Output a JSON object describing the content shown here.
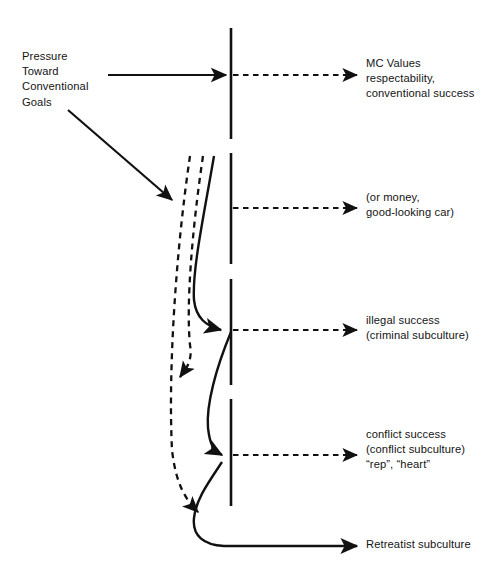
{
  "figure": {
    "type": "flow-diagram",
    "background_color": "#ffffff",
    "line_color": "#111111",
    "width": 492,
    "height": 579
  },
  "labels": {
    "pressure": "Pressure\nToward\nConventional\nGoals",
    "mc_values": "MC Values\nrespectability,\nconventional success",
    "money": "(or money,\ngood-looking car)",
    "illegal": "illegal success\n(criminal subculture)",
    "conflict": "conflict success\n(conflict subculture)\n“rep”, “heart”",
    "retreatist": "Retreatist subculture"
  },
  "structure": {
    "barrier_name": "opportunity-barrier",
    "barrier_style": "vertical dashed line",
    "outcomes": [
      {
        "name": "mc-values",
        "line": "dashed",
        "crosses_barrier": true
      },
      {
        "name": "money",
        "line": "dashed",
        "crosses_barrier": true
      },
      {
        "name": "illegal-success",
        "line": "dashed",
        "crosses_barrier": true
      },
      {
        "name": "conflict-success",
        "line": "dashed",
        "crosses_barrier": true
      },
      {
        "name": "retreatist-subculture",
        "line": "solid",
        "crosses_barrier": true
      }
    ],
    "blocked_paths": [
      {
        "name": "blocked-path-upper",
        "line": "dashed"
      },
      {
        "name": "blocked-path-lower",
        "line": "dashed"
      }
    ],
    "open_paths": [
      {
        "name": "open-path-illegal",
        "line": "solid"
      },
      {
        "name": "open-path-conflict",
        "line": "solid"
      },
      {
        "name": "open-path-retreatist",
        "line": "solid"
      }
    ]
  }
}
